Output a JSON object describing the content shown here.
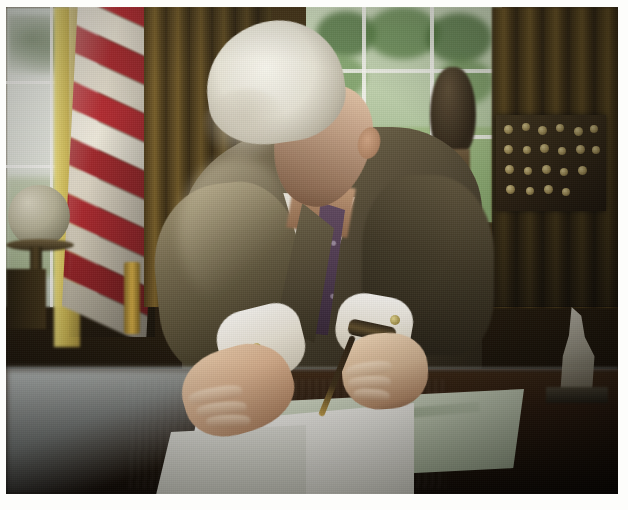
{
  "photo": {
    "medium": "scanned color photograph print",
    "border": "white paper margin",
    "subject": "man in suit signing a document at a desk",
    "setting": "Oval Office",
    "orientation": "landscape",
    "caption": ""
  },
  "scene": {
    "background": {
      "left_window": "bright overexposed window",
      "right_window": "window with green lawn and trees",
      "drapes": "gold and brown pleated drapes",
      "flag": "American flag in folds"
    },
    "objects": [
      {
        "name": "globe",
        "position": "lower left",
        "description": "globe on dark wooden stand"
      },
      {
        "name": "bronze-bust",
        "position": "upper right of center",
        "description": "dark bust silhouetted against window"
      },
      {
        "name": "display-board",
        "position": "right",
        "description": "dark board with rows of small coins or medals"
      },
      {
        "name": "figurine",
        "position": "right desk edge",
        "description": "small pale figurine"
      },
      {
        "name": "brass-lamp",
        "position": "left of desk",
        "description": "brass stand detail"
      },
      {
        "name": "chair",
        "position": "far left",
        "description": "dark wooden chair leg"
      }
    ],
    "person": {
      "hair": "white silver hair",
      "pose": "head bowed, writing",
      "suit": "olive brown suit jacket",
      "shirt": "white dress shirt with french cuffs",
      "tie": "purple patterned necktie",
      "accessories": [
        "gold cufflinks",
        "wristwatch",
        "pen"
      ]
    },
    "desk": {
      "description": "polished dark wood desk with bright reflection",
      "items": [
        "white document",
        "green folder or blotter"
      ]
    }
  },
  "colors": {
    "flag_red": "#b5202a",
    "flag_white": "#f0ece0",
    "curtain_gold": "#d8c255",
    "drape_brown": "#6d5320",
    "window_green": "#8cae74",
    "suit_olive": "#5c523c",
    "tie_purple": "#4a3550",
    "skin": "#dcb391",
    "desk_wood": "#26160a",
    "document_white": "#ffffff",
    "folder_green": "#c6d2bb",
    "photo_border": "#fdfdfb"
  }
}
